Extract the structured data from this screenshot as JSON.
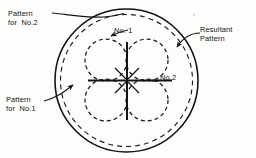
{
  "figure": {
    "background_color": "#fdfdfb",
    "ink_color": "#131313",
    "labels": {
      "pattern_for_no2_line1": "Pattern",
      "pattern_for_no2_line2": "for  No.2",
      "pattern_for_no1_line1": "Pattern",
      "pattern_for_no1_line2": "for  No.1",
      "resultant_line1": "Resultant",
      "resultant_line2": "Pattern",
      "no1": "No. 1",
      "no2": "No.2"
    },
    "geometry": {
      "main_circle": {
        "cx": 126.5,
        "cy": 80.5,
        "r": 71.5,
        "style": "solid",
        "stroke_width": 1.6
      },
      "petal_radius": 21.0,
      "petals": [
        {
          "name": "upper-left-lobe",
          "cx": 106.0,
          "cy": 60.0
        },
        {
          "name": "upper-right-lobe",
          "cx": 147.0,
          "cy": 60.0
        },
        {
          "name": "lower-left-lobe",
          "cx": 106.0,
          "cy": 100.0
        },
        {
          "name": "lower-right-lobe",
          "cx": 147.0,
          "cy": 100.0
        }
      ],
      "axis_horizontal": {
        "x1": 88.0,
        "y1": 80.5,
        "x2": 172.0,
        "y2": 80.5
      },
      "axis_vertical": {
        "x1": 127.0,
        "y1": 42.0,
        "x2": 127.0,
        "y2": 120.0
      },
      "dash_pattern": "4 3"
    },
    "leaders": [
      {
        "name": "leader-pattern-no2",
        "path": "M 52 13 C 74 15, 98 22, 126 13.5",
        "arrow": false
      },
      {
        "name": "leader-pattern-no1",
        "path": "M 44 100 C 56 96, 64 90, 74 84",
        "arrow": true
      },
      {
        "name": "leader-resultant",
        "path": "M 199 34 C 190 34, 182 38, 176 46",
        "arrow": true
      },
      {
        "name": "leader-no1",
        "path": "M 127 30 C 122 31, 116 33, 110 36",
        "arrow": true
      }
    ]
  }
}
